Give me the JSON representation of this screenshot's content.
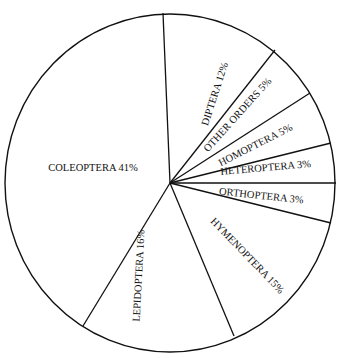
{
  "caption": "(cut-off subtitle text)",
  "chart_data": {
    "type": "pie",
    "title": "",
    "categories": [
      "DIPTERA",
      "OTHER ORDERS",
      "HOMOPTERA",
      "HETEROPTERA",
      "ORTHOPTERA",
      "HYMENOPTERA",
      "LEPIDOPTERA",
      "COLEOPTERA"
    ],
    "values": [
      12,
      5,
      5,
      3,
      3,
      15,
      16,
      41
    ],
    "unit": "%",
    "legend": "none (labels inside slices)",
    "stroke_color": "#111111",
    "fill_color": "#ffffff",
    "labels": [
      {
        "text": "DIPTERA 12%",
        "x": 218,
        "y": 95,
        "rot": -72
      },
      {
        "text": "OTHER ORDERS 5%",
        "x": 240,
        "y": 117,
        "rot": -48
      },
      {
        "text": "HOMOPTERA 5%",
        "x": 257,
        "y": 148,
        "rot": -27
      },
      {
        "text": "HETEROPTERA 3%",
        "x": 266,
        "y": 171,
        "rot": -5
      },
      {
        "text": "ORTHOPTERA 3%",
        "x": 261,
        "y": 199,
        "rot": 6
      },
      {
        "text": "HYMENOPTERA 15%",
        "x": 245,
        "y": 258,
        "rot": 46
      },
      {
        "text": "LEPIDOPTERA 16%",
        "x": 142,
        "y": 276,
        "rot": -87
      },
      {
        "text": "COLEOPTERA 41%",
        "x": 93,
        "y": 171,
        "rot": 0
      }
    ]
  },
  "geometry": {
    "cx": 170,
    "cy": 183,
    "rx": 165,
    "ry": 169,
    "spokes": [
      [
        163,
        13
      ],
      [
        275,
        50
      ],
      [
        310,
        93
      ],
      [
        331,
        143
      ],
      [
        336,
        183
      ],
      [
        331,
        223
      ],
      [
        234,
        336
      ],
      [
        83,
        326
      ]
    ]
  }
}
